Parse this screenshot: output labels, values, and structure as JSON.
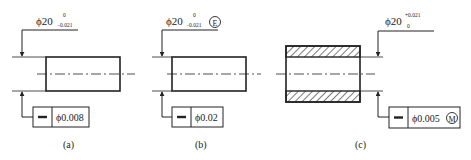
{
  "figures": [
    {
      "caption": "(a)",
      "dimension": {
        "symbol": "ϕ",
        "nominal": "20",
        "upper": "0",
        "lower": "−0.021",
        "modifier": ""
      },
      "fcf": {
        "characteristic": "straightness",
        "tolerance": "ϕ0.008",
        "modifier": ""
      }
    },
    {
      "caption": "(b)",
      "dimension": {
        "symbol": "ϕ",
        "nominal": "20",
        "upper": "0",
        "lower": "−0.021",
        "modifier": "E"
      },
      "fcf": {
        "characteristic": "straightness",
        "tolerance": "ϕ0.02",
        "modifier": ""
      }
    },
    {
      "caption": "(c)",
      "dimension": {
        "symbol": "ϕ",
        "nominal": "20",
        "upper": "+0.021",
        "lower": "0",
        "modifier": ""
      },
      "fcf": {
        "characteristic": "straightness",
        "tolerance": "ϕ0.005",
        "modifier": "M"
      }
    }
  ]
}
